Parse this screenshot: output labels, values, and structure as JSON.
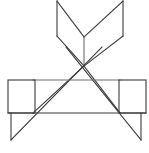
{
  "figure": {
    "title": "Geometric line figure",
    "canvas": {
      "width": 149,
      "height": 153,
      "background_color": "#ffffff"
    },
    "style": {
      "stroke_color": "#3b3b3b",
      "stroke_color_light": "#6e6e6e",
      "stroke_width": 1.1,
      "fill": "none"
    },
    "vertices": {
      "top_left_peak": [
        57,
        1
      ],
      "top_right_peak": [
        123,
        1
      ],
      "left_wing_bottom": [
        57,
        36
      ],
      "right_wing_bottom": [
        123,
        36
      ],
      "v_notch": [
        84,
        37
      ],
      "center_cross": [
        84,
        66
      ],
      "apex_left_inner": [
        66,
        47
      ],
      "apex_right_inner": [
        102,
        47
      ],
      "upper_bar_y": 80,
      "upper_bar_left": [
        33,
        80
      ],
      "upper_bar_right": [
        120,
        80
      ],
      "base_bar_y": 113,
      "base_bar_left": [
        8,
        113
      ],
      "base_bar_right": [
        146,
        113
      ],
      "left_rect": [
        8,
        80,
        35,
        113
      ],
      "right_rect": [
        119,
        80,
        146,
        113
      ],
      "left_leg_foot": [
        11,
        140
      ],
      "right_leg_foot": [
        141,
        140
      ]
    },
    "shapes": [
      {
        "id": "left-wing-panel",
        "name": "left-wing-quad",
        "type": "polygon",
        "points": "57,1 57,36 84,66 84,37"
      },
      {
        "id": "right-wing-panel",
        "name": "right-wing-quad",
        "type": "polygon",
        "points": "123,1 123,36 84,66 84,37"
      },
      {
        "id": "center-vertical",
        "name": "center-vertical-line",
        "type": "line",
        "points": "84,37 84,66"
      },
      {
        "id": "left-rect",
        "name": "left-square-panel",
        "type": "rect",
        "points": "8,80 35,80 35,113 8,113"
      },
      {
        "id": "right-rect",
        "name": "right-square-panel",
        "type": "rect",
        "points": "119,80 146,80 146,113 119,113"
      },
      {
        "id": "upper-cross-bar",
        "name": "upper-horizontal-bar",
        "type": "line",
        "points": "33,80 120,80"
      },
      {
        "id": "base-bar",
        "name": "base-horizontal-bar",
        "type": "line",
        "points": "8,113 146,113"
      },
      {
        "id": "triangle-left-side",
        "name": "triangle-left-edge",
        "type": "line",
        "points": "84,66 33,113"
      },
      {
        "id": "triangle-right-side",
        "name": "triangle-right-edge",
        "type": "line",
        "points": "84,66 120,113"
      },
      {
        "id": "long-diagonal-ne",
        "name": "long-diagonal-up-right",
        "type": "line",
        "points": "11,140 102,47"
      },
      {
        "id": "long-diagonal-nw",
        "name": "long-diagonal-up-left",
        "type": "line",
        "points": "141,140 66,47"
      },
      {
        "id": "left-leg",
        "name": "left-vertical-leg",
        "type": "line",
        "points": "11,113 11,140"
      },
      {
        "id": "right-leg",
        "name": "right-vertical-leg",
        "type": "line",
        "points": "141,113 141,140"
      }
    ],
    "counts": {
      "rectangles": 2,
      "segments": 14
    }
  }
}
